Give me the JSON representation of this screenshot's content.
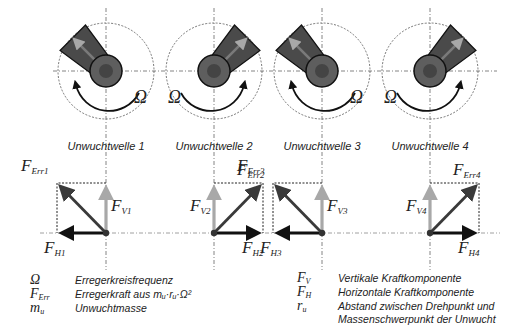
{
  "shafts": [
    {
      "label": "Unwuchtwelle 1",
      "omega": "Ω",
      "omega_side": "right",
      "rotation": "ccw",
      "arm_dir": "upper-left",
      "forces": {
        "err": "Err1",
        "v": "V1",
        "h": "H1",
        "h_dir": "left"
      }
    },
    {
      "label": "Unwuchtwelle 2",
      "omega": "Ω",
      "omega_side": "left",
      "rotation": "cw",
      "arm_dir": "upper-right",
      "forces": {
        "err": "Err2",
        "v": "V2",
        "h": "H2",
        "h_dir": "right"
      }
    },
    {
      "label": "Unwuchtwelle 3",
      "omega": "Ω",
      "omega_side": "right",
      "rotation": "ccw",
      "arm_dir": "upper-left",
      "forces": {
        "err": "Err3",
        "v": "V3",
        "h": "H3",
        "h_dir": "left"
      }
    },
    {
      "label": "Unwuchtwelle 4",
      "omega": "Ω",
      "omega_side": "left",
      "rotation": "cw",
      "arm_dir": "upper-right",
      "forces": {
        "err": "Err4",
        "v": "V4",
        "h": "H4",
        "h_dir": "right"
      }
    }
  ],
  "force_symbol": "F",
  "legend": {
    "left": [
      {
        "symbol": "Ω",
        "sub": "",
        "text": "Erregerkreisfrequenz"
      },
      {
        "symbol": "F",
        "sub": "Err",
        "text": "Erregerkraft aus mᵤ·rᵤ·Ω²"
      },
      {
        "symbol": "m",
        "sub": "u",
        "text": "Unwuchtmasse"
      }
    ],
    "right": [
      {
        "symbol": "F",
        "sub": "V",
        "text": "Vertikale Kraftkomponente"
      },
      {
        "symbol": "F",
        "sub": "H",
        "text": "Horizontale Kraftkomponente"
      },
      {
        "symbol": "r",
        "sub": "u",
        "text": "Abstand zwischen Drehpunkt und",
        "text2": "Massenschwerpunkt der Unwucht"
      }
    ]
  },
  "colors": {
    "arm": "#4a4a4a",
    "hub": "#5e5e5e",
    "hub_inner": "#444444",
    "err_vector": "#3a3a3a",
    "v_vector": "#a8a8a8",
    "h_vector": "#111111",
    "dashed": "#555555"
  }
}
